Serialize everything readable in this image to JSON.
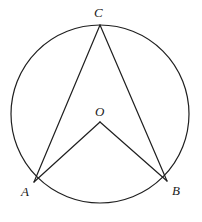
{
  "figure": {
    "kind": "circle-geometry-diagram",
    "width": 202,
    "height": 222,
    "background_color": "#ffffff",
    "stroke_color": "#1f1f1f",
    "stroke_width": 1.2
  },
  "circle": {
    "name": "main-circle",
    "center_x": 100,
    "center_y": 114,
    "radius": 89,
    "filled": false
  },
  "points": [
    {
      "id": "C",
      "label": "C",
      "x": 100,
      "y": 25,
      "on_circle": true,
      "label_x": 94,
      "label_y": 6
    },
    {
      "id": "O",
      "label": "O",
      "x": 100,
      "y": 122,
      "on_circle": false,
      "label_x": 95,
      "label_y": 105
    },
    {
      "id": "A",
      "label": "A",
      "x": 34,
      "y": 182,
      "on_circle": true,
      "label_x": 21,
      "label_y": 185
    },
    {
      "id": "B",
      "label": "B",
      "x": 167,
      "y": 181,
      "on_circle": true,
      "label_x": 172,
      "label_y": 184
    }
  ],
  "segments": [
    {
      "id": "CA",
      "name": "chord-c-to-a",
      "from": "C",
      "to": "A",
      "x1": 100,
      "y1": 25,
      "x2": 34,
      "y2": 182
    },
    {
      "id": "CB",
      "name": "chord-c-to-b",
      "from": "C",
      "to": "B",
      "x1": 100,
      "y1": 25,
      "x2": 167,
      "y2": 181
    },
    {
      "id": "OA",
      "name": "radius-o-to-a",
      "from": "O",
      "to": "A",
      "x1": 100,
      "y1": 122,
      "x2": 34,
      "y2": 182
    },
    {
      "id": "OB",
      "name": "radius-o-to-b",
      "from": "O",
      "to": "B",
      "x1": 100,
      "y1": 122,
      "x2": 167,
      "y2": 181
    }
  ],
  "labels": {
    "C": "C",
    "O": "O",
    "A": "A",
    "B": "B"
  }
}
